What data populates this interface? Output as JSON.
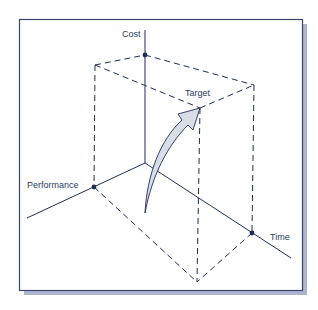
{
  "diagram": {
    "axes": {
      "cost": "Cost",
      "performance": "Performance",
      "time": "Time"
    },
    "target_label": "Target",
    "colors": {
      "ink": "#1f2d5a",
      "frame": "#3a4570",
      "shadow": "#5c6b9a",
      "arrow_fill": "#d8dde6"
    }
  }
}
